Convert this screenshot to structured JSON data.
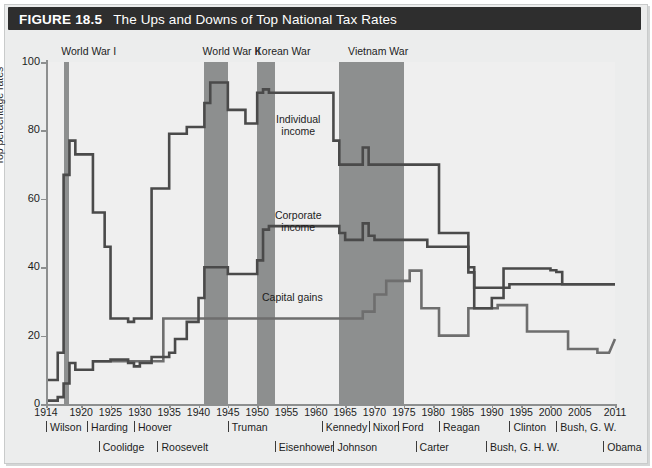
{
  "figure": {
    "number": "FIGURE 18.5",
    "title": "The Ups and Downs of Top National Tax Rates"
  },
  "chart_data": {
    "type": "line",
    "title": "The Ups and Downs of Top National Tax Rates",
    "xlabel": "",
    "ylabel": "Top percentage rates",
    "xlim": [
      1914,
      2011
    ],
    "ylim": [
      0,
      100
    ],
    "grid": false,
    "legend_position": "inline-annotations",
    "yticks": [
      0,
      20,
      40,
      60,
      80,
      100
    ],
    "xticks": [
      1914,
      1920,
      1925,
      1930,
      1935,
      1940,
      1945,
      1950,
      1955,
      1960,
      1965,
      1970,
      1975,
      1980,
      1985,
      1990,
      1995,
      2000,
      2005,
      2011
    ],
    "series": [
      {
        "name": "Individual income",
        "color": "#4a4a4a",
        "points": [
          [
            1914,
            7
          ],
          [
            1916,
            7
          ],
          [
            1916,
            15
          ],
          [
            1917,
            15
          ],
          [
            1917,
            67
          ],
          [
            1918,
            67
          ],
          [
            1918,
            77
          ],
          [
            1919,
            77
          ],
          [
            1919,
            73
          ],
          [
            1921,
            73
          ],
          [
            1921,
            73
          ],
          [
            1922,
            73
          ],
          [
            1922,
            56
          ],
          [
            1923,
            56
          ],
          [
            1923,
            56
          ],
          [
            1924,
            56
          ],
          [
            1924,
            46
          ],
          [
            1925,
            46
          ],
          [
            1925,
            25
          ],
          [
            1928,
            25
          ],
          [
            1928,
            24
          ],
          [
            1929,
            24
          ],
          [
            1929,
            25
          ],
          [
            1931,
            25
          ],
          [
            1931,
            25
          ],
          [
            1932,
            25
          ],
          [
            1932,
            63
          ],
          [
            1935,
            63
          ],
          [
            1935,
            79
          ],
          [
            1936,
            79
          ],
          [
            1936,
            79
          ],
          [
            1938,
            79
          ],
          [
            1938,
            81
          ],
          [
            1940,
            81
          ],
          [
            1940,
            81
          ],
          [
            1941,
            81
          ],
          [
            1941,
            88
          ],
          [
            1942,
            88
          ],
          [
            1942,
            94
          ],
          [
            1944,
            94
          ],
          [
            1944,
            94
          ],
          [
            1945,
            94
          ],
          [
            1945,
            86
          ],
          [
            1946,
            86
          ],
          [
            1946,
            86
          ],
          [
            1948,
            86
          ],
          [
            1948,
            82
          ],
          [
            1950,
            82
          ],
          [
            1950,
            91
          ],
          [
            1951,
            91
          ],
          [
            1951,
            92
          ],
          [
            1952,
            92
          ],
          [
            1952,
            91
          ],
          [
            1963,
            91
          ],
          [
            1963,
            77
          ],
          [
            1964,
            77
          ],
          [
            1964,
            70
          ],
          [
            1968,
            70
          ],
          [
            1968,
            75
          ],
          [
            1969,
            75
          ],
          [
            1969,
            70
          ],
          [
            1970,
            70
          ],
          [
            1970,
            70
          ],
          [
            1981,
            70
          ],
          [
            1981,
            50
          ],
          [
            1986,
            50
          ],
          [
            1986,
            38.5
          ],
          [
            1987,
            38.5
          ],
          [
            1987,
            28
          ],
          [
            1990,
            28
          ],
          [
            1990,
            31
          ],
          [
            1992,
            31
          ],
          [
            1992,
            39.6
          ],
          [
            1993,
            39.6
          ],
          [
            1993,
            39.6
          ],
          [
            2000,
            39.6
          ],
          [
            2000,
            39.1
          ],
          [
            2001,
            39.1
          ],
          [
            2001,
            38.6
          ],
          [
            2002,
            38.6
          ],
          [
            2002,
            35
          ],
          [
            2008,
            35
          ],
          [
            2008,
            35
          ],
          [
            2011,
            35
          ]
        ]
      },
      {
        "name": "Corporate income",
        "color": "#4a4a4a",
        "points": [
          [
            1914,
            1
          ],
          [
            1916,
            1
          ],
          [
            1916,
            2
          ],
          [
            1917,
            2
          ],
          [
            1917,
            6
          ],
          [
            1918,
            6
          ],
          [
            1918,
            12
          ],
          [
            1919,
            12
          ],
          [
            1919,
            10
          ],
          [
            1921,
            10
          ],
          [
            1921,
            10
          ],
          [
            1922,
            10
          ],
          [
            1922,
            12.5
          ],
          [
            1925,
            12.5
          ],
          [
            1925,
            13
          ],
          [
            1928,
            13
          ],
          [
            1928,
            12
          ],
          [
            1929,
            12
          ],
          [
            1929,
            11
          ],
          [
            1930,
            11
          ],
          [
            1930,
            12
          ],
          [
            1932,
            12
          ],
          [
            1932,
            13.75
          ],
          [
            1935,
            13.75
          ],
          [
            1935,
            15
          ],
          [
            1936,
            15
          ],
          [
            1936,
            19
          ],
          [
            1938,
            19
          ],
          [
            1938,
            24
          ],
          [
            1940,
            24
          ],
          [
            1940,
            31
          ],
          [
            1941,
            31
          ],
          [
            1941,
            40
          ],
          [
            1942,
            40
          ],
          [
            1942,
            40
          ],
          [
            1945,
            40
          ],
          [
            1945,
            38
          ],
          [
            1946,
            38
          ],
          [
            1946,
            38
          ],
          [
            1950,
            38
          ],
          [
            1950,
            42
          ],
          [
            1951,
            42
          ],
          [
            1951,
            51
          ],
          [
            1952,
            51
          ],
          [
            1952,
            52
          ],
          [
            1964,
            52
          ],
          [
            1964,
            50
          ],
          [
            1965,
            50
          ],
          [
            1965,
            48
          ],
          [
            1968,
            48
          ],
          [
            1968,
            52.8
          ],
          [
            1969,
            52.8
          ],
          [
            1969,
            49.2
          ],
          [
            1970,
            49.2
          ],
          [
            1970,
            48
          ],
          [
            1979,
            48
          ],
          [
            1979,
            46
          ],
          [
            1986,
            46
          ],
          [
            1986,
            40
          ],
          [
            1987,
            40
          ],
          [
            1987,
            34
          ],
          [
            1993,
            34
          ],
          [
            1993,
            35
          ],
          [
            2011,
            35
          ]
        ]
      },
      {
        "name": "Capital gains",
        "color": "#6e6e6e",
        "points": [
          [
            1922,
            12.5
          ],
          [
            1934,
            12.5
          ],
          [
            1934,
            25
          ],
          [
            1942,
            25
          ],
          [
            1942,
            25
          ],
          [
            1968,
            25
          ],
          [
            1968,
            27
          ],
          [
            1970,
            27
          ],
          [
            1970,
            32
          ],
          [
            1972,
            32
          ],
          [
            1972,
            36
          ],
          [
            1976,
            36
          ],
          [
            1976,
            39
          ],
          [
            1978,
            39
          ],
          [
            1978,
            28
          ],
          [
            1979,
            28
          ],
          [
            1979,
            28
          ],
          [
            1981,
            28
          ],
          [
            1981,
            20
          ],
          [
            1986,
            20
          ],
          [
            1986,
            28
          ],
          [
            1987,
            28
          ],
          [
            1987,
            28
          ],
          [
            1991,
            28
          ],
          [
            1991,
            28.9
          ],
          [
            1993,
            28.9
          ],
          [
            1993,
            28.9
          ],
          [
            1996,
            28.9
          ],
          [
            1996,
            21.2
          ],
          [
            1998,
            21.2
          ],
          [
            1998,
            21.2
          ],
          [
            2003,
            21.2
          ],
          [
            2003,
            16.1
          ],
          [
            2008,
            16.1
          ],
          [
            2008,
            15
          ],
          [
            2010,
            15
          ],
          [
            2010,
            15
          ],
          [
            2011,
            19
          ]
        ]
      }
    ],
    "wars": [
      {
        "label": "World War I",
        "start": 1917,
        "end": 1918,
        "label_x": 1916.6
      },
      {
        "label": "World War II",
        "start": 1941,
        "end": 1945,
        "label_x": 1940.7
      },
      {
        "label": "Korean War",
        "start": 1950,
        "end": 1953,
        "label_x": 1949.6
      },
      {
        "label": "Vietnam War",
        "start": 1964,
        "end": 1975,
        "label_x": 1965.5
      }
    ],
    "annotations": [
      {
        "text": "Individual income",
        "x": 1957,
        "y": 83
      },
      {
        "text": "Corporate income",
        "x": 1957,
        "y": 55
      },
      {
        "text": "Capital gains",
        "x": 1956,
        "y": 31
      }
    ]
  },
  "presidents": {
    "row1": [
      {
        "name": "Wilson",
        "x": 1914.0
      },
      {
        "name": "Harding",
        "x": 1921.0
      },
      {
        "name": "Hoover",
        "x": 1929.0
      },
      {
        "name": "Truman",
        "x": 1945.0
      },
      {
        "name": "Kennedy",
        "x": 1961.0
      },
      {
        "name": "Nixon",
        "x": 1969.0
      },
      {
        "name": "Ford",
        "x": 1974.0
      },
      {
        "name": "Reagan",
        "x": 1981.0
      },
      {
        "name": "Clinton",
        "x": 1993.0
      },
      {
        "name": "Bush, G. W.",
        "x": 2001.0
      }
    ],
    "row2": [
      {
        "name": "Coolidge",
        "x": 1923.0
      },
      {
        "name": "Roosevelt",
        "x": 1933.0
      },
      {
        "name": "Eisenhower",
        "x": 1953.0
      },
      {
        "name": "Johnson",
        "x": 1963.0
      },
      {
        "name": "Carter",
        "x": 1977.0
      },
      {
        "name": "Bush, G. H. W.",
        "x": 1989.0
      },
      {
        "name": "Obama",
        "x": 2009.0
      }
    ]
  },
  "colors": {
    "titlebar_bg": "#2e2e2e",
    "titlebar_text": "#ffffff",
    "plot_bg": "#efefef",
    "card_bg": "#eceded",
    "war_band": "#8d8f8f",
    "line_dark": "#4a4a4a",
    "line_light": "#6e6e6e",
    "axis": "#8d8f8f"
  }
}
